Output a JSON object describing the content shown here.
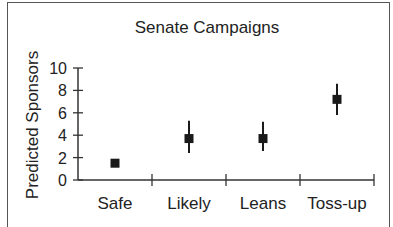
{
  "chart_data": {
    "type": "scatter",
    "title": "Senate Campaigns",
    "xlabel": "",
    "ylabel": "Predicted Sponsors",
    "categories": [
      "Safe",
      "Likely",
      "Leans",
      "Toss-up"
    ],
    "series": [
      {
        "name": "Predicted Sponsors",
        "values": [
          1.5,
          3.7,
          3.7,
          7.2
        ],
        "lower": [
          1.5,
          2.4,
          2.6,
          5.8
        ],
        "upper": [
          1.5,
          5.3,
          5.2,
          8.6
        ]
      }
    ],
    "yticks": [
      0,
      2,
      4,
      6,
      8,
      10
    ],
    "ytick_labels": [
      "0",
      "2",
      "4",
      "6",
      "8",
      "10"
    ],
    "ylim": [
      0,
      10
    ],
    "grid": false,
    "legend": null,
    "marker": "square",
    "error_bars": true
  },
  "colors": {
    "marker": "#1a1a1a",
    "axis": "#333333",
    "text": "#222222",
    "border": "#555555"
  }
}
